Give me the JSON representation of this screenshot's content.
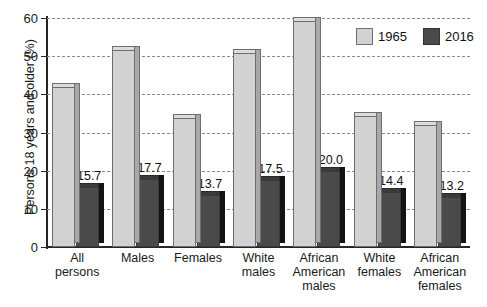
{
  "chart_data": {
    "type": "bar",
    "title": "",
    "xlabel": "",
    "ylabel": "Persons 18 years and older (%)",
    "ylim": [
      0,
      60
    ],
    "yticks": [
      0,
      10,
      20,
      30,
      40,
      50,
      60
    ],
    "grid": true,
    "legend_position": "top-right",
    "categories": [
      "All persons",
      "Males",
      "Females",
      "White males",
      "African American males",
      "White females",
      "African American females"
    ],
    "category_lines": [
      [
        "All",
        "persons"
      ],
      [
        "Males"
      ],
      [
        "Females"
      ],
      [
        "White",
        "males"
      ],
      [
        "African",
        "American",
        "males"
      ],
      [
        "White",
        "females"
      ],
      [
        "African",
        "American",
        "females"
      ]
    ],
    "series": [
      {
        "name": "1965",
        "color": "#d2d2d2",
        "values": [
          42.0,
          51.6,
          33.9,
          50.8,
          59.2,
          34.2,
          32.0
        ],
        "labels": [
          "",
          "",
          "",
          "",
          "",
          "",
          ""
        ]
      },
      {
        "name": "2016",
        "color": "#4a4a4a",
        "values": [
          15.7,
          17.7,
          13.7,
          17.5,
          20.0,
          14.4,
          13.2
        ],
        "labels": [
          "15.7",
          "17.7",
          "13.7",
          "17.5",
          "20.0",
          "14.4",
          "13.2"
        ]
      }
    ]
  },
  "legend": {
    "items": [
      {
        "label": "1965"
      },
      {
        "label": "2016"
      }
    ]
  }
}
